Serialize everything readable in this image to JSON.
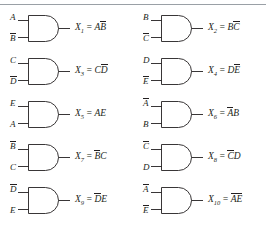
{
  "figure": {
    "divider_color": "#9aa0a6",
    "line_color": "#231f20",
    "background": "#ffffff",
    "gate_type": "AND",
    "columns": 2,
    "rows": 5
  },
  "gates": [
    {
      "id": "gate-1",
      "output_name": "X",
      "output_index": "1",
      "equals": "=",
      "inputs": [
        {
          "letter": "A",
          "bar": false
        },
        {
          "letter": "B",
          "bar": true
        }
      ],
      "expression_terms": [
        {
          "letter": "A",
          "bar": false
        },
        {
          "letter": "B",
          "bar": true
        }
      ],
      "expression_text": "X1 = AB̅"
    },
    {
      "id": "gate-2",
      "output_name": "X",
      "output_index": "2",
      "equals": "=",
      "inputs": [
        {
          "letter": "B",
          "bar": false
        },
        {
          "letter": "C",
          "bar": true
        }
      ],
      "expression_terms": [
        {
          "letter": "B",
          "bar": false
        },
        {
          "letter": "C",
          "bar": true
        }
      ],
      "expression_text": "X2 = BC̅"
    },
    {
      "id": "gate-3",
      "output_name": "X",
      "output_index": "3",
      "equals": "=",
      "inputs": [
        {
          "letter": "C",
          "bar": false
        },
        {
          "letter": "D",
          "bar": true
        }
      ],
      "expression_terms": [
        {
          "letter": "C",
          "bar": false
        },
        {
          "letter": "D",
          "bar": true
        }
      ],
      "expression_text": "X3 = CD̅"
    },
    {
      "id": "gate-4",
      "output_name": "X",
      "output_index": "4",
      "equals": "=",
      "inputs": [
        {
          "letter": "D",
          "bar": false
        },
        {
          "letter": "E",
          "bar": true
        }
      ],
      "expression_terms": [
        {
          "letter": "D",
          "bar": false
        },
        {
          "letter": "E",
          "bar": true
        }
      ],
      "expression_text": "X4 = DE̅"
    },
    {
      "id": "gate-5",
      "output_name": "X",
      "output_index": "5",
      "equals": "=",
      "inputs": [
        {
          "letter": "E",
          "bar": false
        },
        {
          "letter": "A",
          "bar": false
        }
      ],
      "expression_terms": [
        {
          "letter": "A",
          "bar": false
        },
        {
          "letter": "E",
          "bar": false
        }
      ],
      "expression_text": "X5 = AE"
    },
    {
      "id": "gate-6",
      "output_name": "X",
      "output_index": "6",
      "equals": "=",
      "inputs": [
        {
          "letter": "A",
          "bar": true
        },
        {
          "letter": "B",
          "bar": false
        }
      ],
      "expression_terms": [
        {
          "letter": "A",
          "bar": true
        },
        {
          "letter": "B",
          "bar": false
        }
      ],
      "expression_text": "X6 = A̅B"
    },
    {
      "id": "gate-7",
      "output_name": "X",
      "output_index": "7",
      "equals": "=",
      "inputs": [
        {
          "letter": "B",
          "bar": true
        },
        {
          "letter": "C",
          "bar": false
        }
      ],
      "expression_terms": [
        {
          "letter": "B",
          "bar": true
        },
        {
          "letter": "C",
          "bar": false
        }
      ],
      "expression_text": "X7 = B̅C"
    },
    {
      "id": "gate-8",
      "output_name": "X",
      "output_index": "8",
      "equals": "=",
      "inputs": [
        {
          "letter": "C",
          "bar": true
        },
        {
          "letter": "D",
          "bar": false
        }
      ],
      "expression_terms": [
        {
          "letter": "C",
          "bar": true
        },
        {
          "letter": "D",
          "bar": false
        }
      ],
      "expression_text": "X8 = C̅D"
    },
    {
      "id": "gate-9",
      "output_name": "X",
      "output_index": "9",
      "equals": "=",
      "inputs": [
        {
          "letter": "D",
          "bar": true
        },
        {
          "letter": "E",
          "bar": false
        }
      ],
      "expression_terms": [
        {
          "letter": "D",
          "bar": true
        },
        {
          "letter": "E",
          "bar": false
        }
      ],
      "expression_text": "X9 = D̅E"
    },
    {
      "id": "gate-10",
      "output_name": "X",
      "output_index": "10",
      "equals": "=",
      "inputs": [
        {
          "letter": "A",
          "bar": true
        },
        {
          "letter": "E",
          "bar": true
        }
      ],
      "expression_terms": [
        {
          "letter": "A",
          "bar": true
        },
        {
          "letter": "E",
          "bar": true
        }
      ],
      "expression_text": "X10 = A̅E̅"
    }
  ]
}
